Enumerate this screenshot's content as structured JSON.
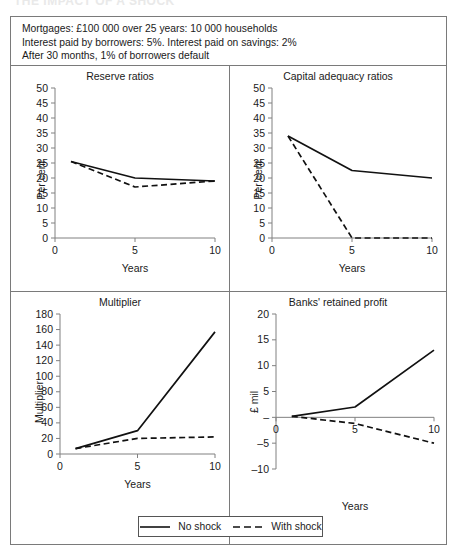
{
  "cropped_title": "THE IMPACT OF A SHOCK",
  "header_note": {
    "lines": [
      "Mortgages: £100 000 over 25 years: 10 000 households",
      "Interest paid by borrowers: 5%. Interest paid on savings: 2%",
      "After 30 months, 1% of borrowers default"
    ]
  },
  "legend": {
    "no_shock": "No shock",
    "with_shock": "With shock"
  },
  "colors": {
    "line": "#111111",
    "frame": "#7a7a7a",
    "axis": "#808080",
    "text": "#1a1a1a"
  },
  "chart_data": [
    {
      "id": "reserve-ratios",
      "type": "line",
      "title": "Reserve ratios",
      "xlabel": "Years",
      "ylabel": "Per cent",
      "x": [
        1,
        5,
        10
      ],
      "xlim": [
        0,
        10
      ],
      "ylim": [
        0,
        50
      ],
      "xticks": [
        0,
        5,
        10
      ],
      "yticks": [
        0,
        5,
        10,
        15,
        20,
        25,
        30,
        35,
        40,
        45,
        50
      ],
      "grid": false,
      "legend_position": "figure-bottom",
      "series": [
        {
          "name": "No shock",
          "style": "solid",
          "values": [
            25.5,
            20.0,
            19.0
          ]
        },
        {
          "name": "With shock",
          "style": "dashed",
          "values": [
            25.5,
            17.0,
            19.0
          ]
        }
      ]
    },
    {
      "id": "capital-adequacy-ratios",
      "type": "line",
      "title": "Capital adequacy ratios",
      "xlabel": "Years",
      "ylabel": "Per cent",
      "x": [
        1,
        5,
        10
      ],
      "xlim": [
        0,
        10
      ],
      "ylim": [
        0,
        50
      ],
      "xticks": [
        0,
        5,
        10
      ],
      "yticks": [
        0,
        5,
        10,
        15,
        20,
        25,
        30,
        35,
        40,
        45,
        50
      ],
      "grid": false,
      "legend_position": "figure-bottom",
      "series": [
        {
          "name": "No shock",
          "style": "solid",
          "values": [
            34.0,
            22.5,
            20.0
          ]
        },
        {
          "name": "With shock",
          "style": "dashed",
          "values": [
            34.0,
            0.0,
            0.0
          ]
        }
      ]
    },
    {
      "id": "multiplier",
      "type": "line",
      "title": "Multiplier",
      "xlabel": "Years",
      "ylabel": "Multiplier",
      "x": [
        1,
        5,
        10
      ],
      "xlim": [
        0,
        10
      ],
      "ylim": [
        0,
        180
      ],
      "xticks": [
        0,
        5,
        10
      ],
      "yticks": [
        0,
        20,
        40,
        60,
        80,
        100,
        120,
        140,
        160,
        180
      ],
      "grid": false,
      "legend_position": "figure-bottom",
      "series": [
        {
          "name": "No shock",
          "style": "solid",
          "values": [
            7,
            30,
            157
          ]
        },
        {
          "name": "With shock",
          "style": "dashed",
          "values": [
            7,
            20,
            22
          ]
        }
      ]
    },
    {
      "id": "banks-retained-profit",
      "type": "line",
      "title": "Banks' retained profit",
      "xlabel": "Years",
      "ylabel": "£ mil",
      "x": [
        1,
        5,
        10
      ],
      "xlim": [
        0,
        10
      ],
      "ylim": [
        -10,
        20
      ],
      "xticks": [
        0,
        5,
        10
      ],
      "yticks": [
        -10,
        -5,
        0,
        5,
        10,
        15,
        20
      ],
      "ytick_labels": [
        "–10",
        "–5",
        "–",
        "5",
        "10",
        "15",
        "20"
      ],
      "grid": false,
      "legend_position": "figure-bottom",
      "series": [
        {
          "name": "No shock",
          "style": "solid",
          "values": [
            0.2,
            2.0,
            13.0
          ]
        },
        {
          "name": "With shock",
          "style": "dashed",
          "values": [
            0.2,
            -1.2,
            -5.0
          ]
        }
      ]
    }
  ]
}
